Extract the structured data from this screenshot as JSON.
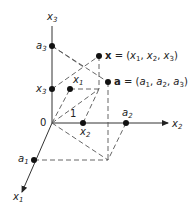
{
  "diagram": {
    "type": "3d-coordinate-axes",
    "axes": {
      "x1": {
        "label": "x",
        "sub": "1"
      },
      "x2": {
        "label": "x",
        "sub": "2"
      },
      "x3": {
        "label": "x",
        "sub": "3"
      }
    },
    "origin_label": "0",
    "unit_label": "1",
    "tick_labels": {
      "a1": {
        "label": "a",
        "sub": "1"
      },
      "a2": {
        "label": "a",
        "sub": "2"
      },
      "a3": {
        "label": "a",
        "sub": "3"
      },
      "x1": {
        "label": "x",
        "sub": "1"
      },
      "x2": {
        "label": "x",
        "sub": "2"
      },
      "x3": {
        "label": "x",
        "sub": "3"
      }
    },
    "points": {
      "x_vec": {
        "name": "x",
        "eq": " = (",
        "c1": "x",
        "s1": "1",
        "c2": "x",
        "s2": "2",
        "c3": "x",
        "s3": "3",
        "close": ")"
      },
      "a_vec": {
        "name": "a",
        "eq": " = (",
        "c1": "a",
        "s1": "1",
        "c2": "a",
        "s2": "2",
        "c3": "a",
        "s3": "3",
        "close": ")"
      }
    },
    "colors": {
      "line": "#333333",
      "dash": "#555555",
      "point": "#111111"
    }
  }
}
